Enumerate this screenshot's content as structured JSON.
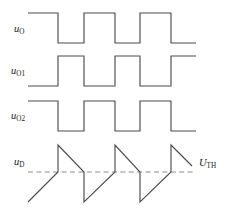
{
  "figure": {
    "type": "timing-diagram",
    "width": 230,
    "height": 211,
    "background_color": "#ffffff",
    "trace_color": "#4d4d4d",
    "threshold_color": "#8c8c8c",
    "label_color": "#1a1a1a"
  },
  "labels": {
    "uo": {
      "base": "u",
      "sub": "O"
    },
    "uo1": {
      "base": "u",
      "sub": "O1"
    },
    "uo2": {
      "base": "u",
      "sub": "O2"
    },
    "ud": {
      "base": "u",
      "sub": "D"
    },
    "uth": {
      "base": "U",
      "sub": "TH"
    }
  },
  "chart_data": {
    "type": "line",
    "title": "",
    "xlabel": "",
    "ylabel": "",
    "grid": false,
    "legend": false,
    "xlim": [
      36,
      196
    ],
    "annotations": [
      {
        "name": "threshold-label",
        "text": "U_TH",
        "x": 199,
        "y": 162
      }
    ],
    "threshold": {
      "name": "U_TH",
      "y": 172,
      "x_start": 28,
      "x_end": 196,
      "style": "dashed"
    },
    "series": [
      {
        "name": "u_O",
        "kind": "square",
        "y_high": 13,
        "y_low": 43,
        "x_start": 28,
        "x_end": 196,
        "points": [
          [
            28,
            13
          ],
          [
            58,
            13
          ],
          [
            58,
            43
          ],
          [
            84,
            43
          ],
          [
            84,
            13
          ],
          [
            115,
            13
          ],
          [
            115,
            43
          ],
          [
            140,
            43
          ],
          [
            140,
            13
          ],
          [
            171,
            13
          ],
          [
            171,
            43
          ],
          [
            196,
            43
          ]
        ]
      },
      {
        "name": "u_O1",
        "kind": "square",
        "y_high": 56,
        "y_low": 86,
        "x_start": 28,
        "x_end": 196,
        "points": [
          [
            28,
            86
          ],
          [
            58,
            86
          ],
          [
            58,
            56
          ],
          [
            84,
            56
          ],
          [
            84,
            86
          ],
          [
            115,
            86
          ],
          [
            115,
            56
          ],
          [
            140,
            56
          ],
          [
            140,
            86
          ],
          [
            171,
            86
          ],
          [
            171,
            56
          ],
          [
            196,
            56
          ]
        ]
      },
      {
        "name": "u_O2",
        "kind": "square",
        "y_high": 101,
        "y_low": 131,
        "x_start": 28,
        "x_end": 196,
        "points": [
          [
            28,
            101
          ],
          [
            58,
            101
          ],
          [
            58,
            131
          ],
          [
            84,
            131
          ],
          [
            84,
            101
          ],
          [
            115,
            101
          ],
          [
            115,
            131
          ],
          [
            140,
            131
          ],
          [
            140,
            101
          ],
          [
            171,
            101
          ],
          [
            171,
            131
          ],
          [
            196,
            131
          ]
        ]
      },
      {
        "name": "u_D",
        "kind": "sawtooth",
        "y_peak": 145,
        "y_threshold": 172,
        "y_valley": 202,
        "x_start": 28,
        "x_end": 196,
        "points": [
          [
            28,
            202
          ],
          [
            58,
            172
          ],
          [
            58,
            145
          ],
          [
            84,
            172
          ],
          [
            84,
            202
          ],
          [
            115,
            172
          ],
          [
            115,
            145
          ],
          [
            140,
            172
          ],
          [
            140,
            202
          ],
          [
            171,
            172
          ],
          [
            171,
            145
          ],
          [
            192,
            166
          ]
        ]
      }
    ]
  }
}
